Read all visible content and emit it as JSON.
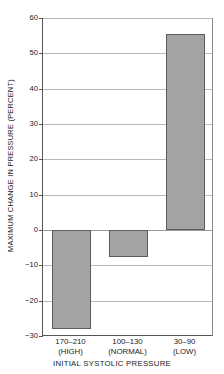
{
  "chart_data": {
    "type": "bar",
    "title": "",
    "subtitle": "",
    "xlabel": "INITIAL SYSTOLIC PRESSURE",
    "ylabel": "MAXIMUM CHANGE IN PRESSURE (PERCENT)",
    "categories": [
      "170–210",
      "100–130",
      "30–90"
    ],
    "category_qualifiers": [
      "(HIGH)",
      "(NORMAL)",
      "(LOW)"
    ],
    "category_labels": [
      "170–210 (HIGH)",
      "100–130 (NORMAL)",
      "30–90 (LOW)"
    ],
    "values": [
      -28,
      -7.5,
      55.5
    ],
    "ylim": [
      -30,
      60
    ],
    "ytick_labels": [
      "60",
      "50",
      "40",
      "30",
      "20",
      "10",
      "0",
      "−10",
      "−20",
      "−30"
    ],
    "ytick_values": [
      60,
      50,
      40,
      30,
      20,
      10,
      0,
      -10,
      -20,
      -30
    ],
    "grid": true,
    "legend": "none",
    "bar_color": "#a3a3a3",
    "bar_edge_color": "#5d5d5d",
    "grid_color": "#b9b9b9",
    "axis_color": "#555555",
    "background": "#ffffff",
    "zero_reference": 0,
    "annotations": []
  }
}
